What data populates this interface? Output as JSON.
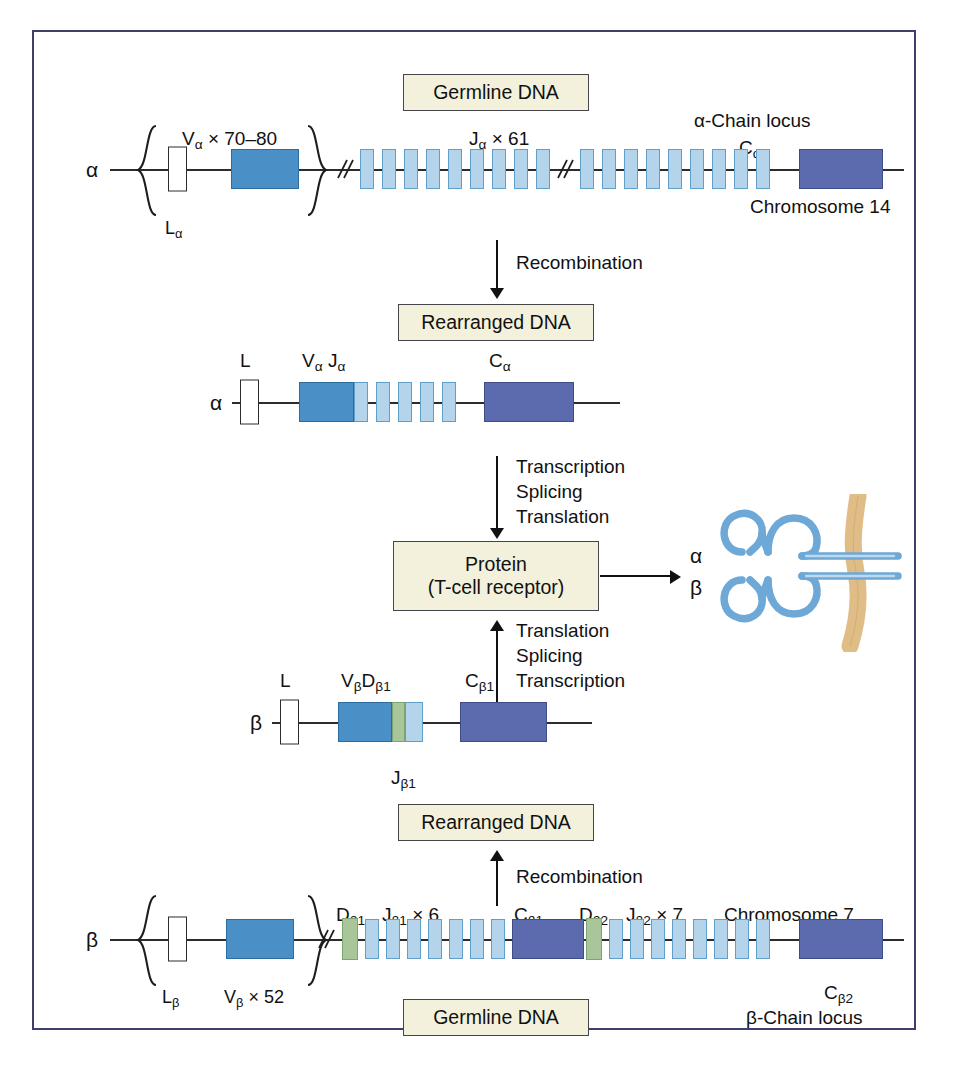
{
  "figure": {
    "border_color": "#3f3f6b",
    "background": "#ffffff"
  },
  "colors": {
    "leader_L": "#ffffff",
    "V_segment": "#4a90c6",
    "J_segment": "#b3d4ea",
    "C_segment": "#5b6bae",
    "D_segment": "#a8c69a",
    "caption_box": "#f3f1dc",
    "membrane": "#e0bd86",
    "receptor": "#7db0da"
  },
  "captions": {
    "germline_top": "Germline DNA",
    "rearranged_top": "Rearranged DNA",
    "protein_line1": "Protein",
    "protein_line2": "(T-cell receptor)",
    "rearranged_bottom": "Rearranged DNA",
    "germline_bottom": "Germline DNA"
  },
  "process_arrows": {
    "recombination_top": "Recombination",
    "transcription_down": [
      "Transcription",
      "Splicing",
      "Translation"
    ],
    "translation_up": [
      "Translation",
      "Splicing",
      "Transcription"
    ],
    "recombination_bottom": "Recombination"
  },
  "alpha_germline": {
    "chain_symbol": "α",
    "locus_title": "α-Chain locus",
    "chromosome": "Chromosome 14",
    "leader_label": "L",
    "leader_sub": "α",
    "v_label": "V",
    "v_sub": "α",
    "v_count": "× 70–80",
    "j_label": "J",
    "j_sub": "α",
    "j_count": "× 61",
    "c_label": "C",
    "c_sub": "α",
    "j_boxes_group1": 9,
    "j_boxes_group2": 9
  },
  "alpha_rearranged": {
    "chain_symbol": "α",
    "leader_label": "L",
    "v_label": "V",
    "v_sub": "α",
    "j_label": "J",
    "j_sub": "α",
    "c_label": "C",
    "c_sub": "α",
    "j_boxes": 5
  },
  "beta_rearranged": {
    "chain_symbol": "β",
    "leader_label": "L",
    "v_label": "V",
    "v_sub": "β",
    "d_label": "D",
    "d_sub": "β1",
    "j_label": "J",
    "j_sub": "β1",
    "c_label": "C",
    "c_sub": "β1"
  },
  "beta_germline": {
    "chain_symbol": "β",
    "locus_title": "β-Chain locus",
    "chromosome": "Chromosome 7",
    "leader_label": "L",
    "leader_sub": "β",
    "v_label": "V",
    "v_sub": "β",
    "v_count": "× 52",
    "d1_label": "D",
    "d1_sub": "β1",
    "j1_label": "J",
    "j1_sub": "β1",
    "j1_count": "× 6",
    "c1_label": "C",
    "c1_sub": "β1",
    "d2_label": "D",
    "d2_sub": "β2",
    "j2_label": "J",
    "j2_sub": "β2",
    "j2_count": "× 7",
    "c2_label": "C",
    "c2_sub": "β2",
    "j1_boxes": 7,
    "j2_boxes": 8
  },
  "receptor": {
    "alpha_label": "α",
    "beta_label": "β"
  }
}
